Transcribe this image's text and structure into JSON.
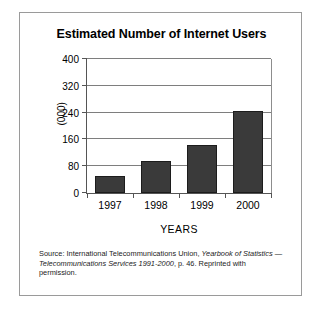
{
  "figure": {
    "title": "Estimated Number of Internet Users",
    "yaxis_title": "(000)",
    "xaxis_title": "YEARS",
    "source_prefix": "Source: International Telecommunications Union, ",
    "source_italic_1": "Yearbook of Statistics — Telecommunications Services 1991-2000",
    "source_suffix": ", p. 46. Reprinted with permission."
  },
  "chart_data": {
    "type": "bar",
    "title": "Estimated Number of Internet Users",
    "xlabel": "YEARS",
    "ylabel": "(000)",
    "categories": [
      "1997",
      "1998",
      "1999",
      "2000"
    ],
    "values": [
      52,
      96,
      143,
      245
    ],
    "ylim": [
      0,
      400
    ],
    "yticks": [
      0,
      80,
      160,
      240,
      320,
      400
    ],
    "ytick_labels": [
      "0",
      "80",
      "160",
      "240",
      "320",
      "400"
    ],
    "grid": true,
    "legend": false,
    "bar_color": "#3a3a3a",
    "axis_color": "#555555",
    "gridline_color": "#7e7e7e"
  },
  "ticks": {
    "y": [
      {
        "value": 400,
        "label": "400"
      },
      {
        "value": 320,
        "label": "320"
      },
      {
        "value": 240,
        "label": "240"
      },
      {
        "value": 160,
        "label": "160"
      },
      {
        "value": 80,
        "label": "80"
      },
      {
        "value": 0,
        "label": "0"
      }
    ]
  }
}
